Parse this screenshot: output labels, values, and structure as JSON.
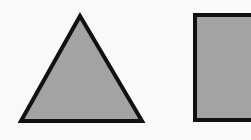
{
  "canvas": {
    "width": 251,
    "height": 140,
    "background": "#f9f9f9"
  },
  "shapes": [
    {
      "id": "triangle",
      "kind": "triangle",
      "points": [
        [
          80,
          16
        ],
        [
          21,
          121
        ],
        [
          142,
          121
        ]
      ],
      "fill": "#a3a3a3",
      "stroke": "#111111",
      "stroke_width": 4
    },
    {
      "id": "square",
      "kind": "rectangle",
      "x": 195,
      "y": 15,
      "width": 60,
      "height": 105,
      "fill": "#a3a3a3",
      "stroke": "#111111",
      "stroke_width": 4
    }
  ]
}
